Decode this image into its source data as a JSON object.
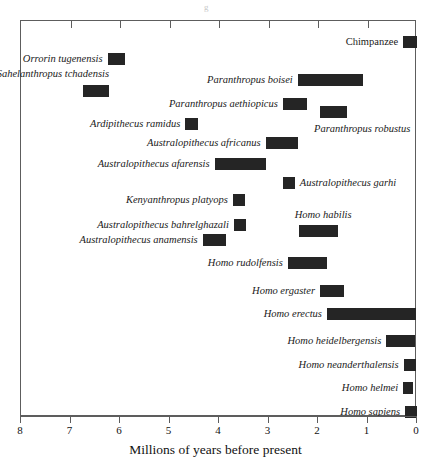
{
  "figure": {
    "axis_title": "Millions of years before present",
    "x_tick_labels": [
      "8",
      "7",
      "6",
      "5",
      "4",
      "3",
      "2",
      "1",
      "0"
    ],
    "bar_color": "#252525",
    "frame_color": "#5d5d5d",
    "top_mark": "g"
  },
  "chart_data": {
    "type": "bar",
    "orientation": "horizontal-range",
    "title": "",
    "xlabel": "Millions of years before present",
    "ylabel": "",
    "xlim": [
      8,
      0
    ],
    "x_reversed": true,
    "xticks": [
      8,
      7,
      6,
      5,
      4,
      3,
      2,
      1,
      0
    ],
    "grid": false,
    "legend": "none",
    "units": "millions of years before present",
    "categories": [
      "Chimpanzee",
      "Orrorin tugenensis",
      "Sahelanthropus tchadensis",
      "Paranthropus boisei",
      "Paranthropus aethiopicus",
      "Ardipithecus ramidus",
      "Paranthropus robustus",
      "Australopithecus africanus",
      "Australopithecus afarensis",
      "Australopithecus garhi",
      "Kenyanthropus platyops",
      "Australopithecus bahrelghazali",
      "Homo habilis",
      "Australopithecus anamensis",
      "Homo rudolfensis",
      "Homo ergaster",
      "Homo erectus",
      "Homo heidelbergensis",
      "Homo neanderthalensis",
      "Homo helmei",
      "Homo sapiens"
    ],
    "ranges": [
      {
        "label": "Chimpanzee",
        "start": 0.28,
        "end": 0.0,
        "italic": false,
        "label_side": "left",
        "row": 0
      },
      {
        "label": "Orrorin tugenensis",
        "start": 6.25,
        "end": 5.9,
        "italic": true,
        "label_side": "left",
        "row": 1
      },
      {
        "label": "Sahelanthropus tchadensis",
        "start": 6.75,
        "end": 6.22,
        "italic": true,
        "label_side": "above-left",
        "row": 2
      },
      {
        "label": "Paranthropus boisei",
        "start": 2.41,
        "end": 1.09,
        "italic": true,
        "label_side": "left",
        "row": 2
      },
      {
        "label": "Paranthropus aethiopicus",
        "start": 2.71,
        "end": 2.22,
        "italic": true,
        "label_side": "left",
        "row": 3
      },
      {
        "label": "Ardipithecus ramidus",
        "start": 4.68,
        "end": 4.43,
        "italic": true,
        "label_side": "left",
        "row": 4
      },
      {
        "label": "Paranthropus robustus",
        "start": 1.96,
        "end": 1.42,
        "italic": true,
        "label_side": "below-right",
        "row": 4
      },
      {
        "label": "Australopithecus africanus",
        "start": 3.06,
        "end": 2.41,
        "italic": true,
        "label_side": "left",
        "row": 5
      },
      {
        "label": "Australopithecus afarensis",
        "start": 4.09,
        "end": 3.06,
        "italic": true,
        "label_side": "left",
        "row": 6
      },
      {
        "label": "Australopithecus garhi",
        "start": 2.71,
        "end": 2.47,
        "italic": true,
        "label_side": "right",
        "row": 7
      },
      {
        "label": "Kenyanthropus platyops",
        "start": 3.72,
        "end": 3.48,
        "italic": true,
        "label_side": "left",
        "row": 8
      },
      {
        "label": "Australopithecus bahrelghazali",
        "start": 3.7,
        "end": 3.46,
        "italic": true,
        "label_side": "left",
        "row": 9
      },
      {
        "label": "Homo habilis",
        "start": 2.39,
        "end": 1.6,
        "italic": true,
        "label_side": "above",
        "row": 9
      },
      {
        "label": "Australopithecus anamensis",
        "start": 4.33,
        "end": 3.86,
        "italic": true,
        "label_side": "left",
        "row": 10
      },
      {
        "label": "Homo rudolfensis",
        "start": 2.61,
        "end": 1.82,
        "italic": true,
        "label_side": "left",
        "row": 11
      },
      {
        "label": "Homo ergaster",
        "start": 1.96,
        "end": 1.48,
        "italic": true,
        "label_side": "left",
        "row": 12
      },
      {
        "label": "Homo erectus",
        "start": 1.82,
        "end": 0.02,
        "italic": true,
        "label_side": "left",
        "row": 13
      },
      {
        "label": "Homo heidelbergensis",
        "start": 0.62,
        "end": 0.04,
        "italic": true,
        "label_side": "left",
        "row": 14
      },
      {
        "label": "Homo neanderthalensis",
        "start": 0.27,
        "end": 0.02,
        "italic": true,
        "label_side": "left",
        "row": 15
      },
      {
        "label": "Homo helmei",
        "start": 0.28,
        "end": 0.08,
        "italic": true,
        "label_side": "left",
        "row": 16
      },
      {
        "label": "Homo sapiens",
        "start": 0.24,
        "end": 0.0,
        "italic": true,
        "label_side": "left",
        "row": 17
      }
    ]
  }
}
